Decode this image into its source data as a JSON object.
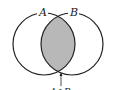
{
  "diagram": {
    "type": "venn",
    "sets": [
      {
        "name": "A",
        "label": "A"
      },
      {
        "name": "B",
        "label": "B"
      }
    ],
    "highlighted_region": {
      "label": "A∩B",
      "fill": "#b8b8b8"
    },
    "colors": {
      "stroke": "#222222",
      "intersection_fill": "#b8b8b8",
      "background": "#ffffff"
    }
  }
}
